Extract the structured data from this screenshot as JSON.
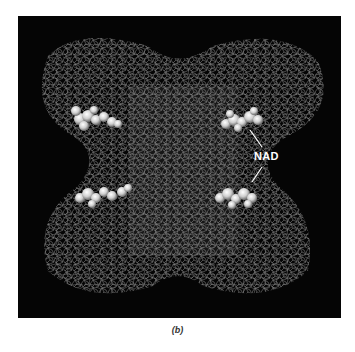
{
  "figure": {
    "panel_label": "(b)",
    "annotation": {
      "text": "NAD"
    },
    "colors": {
      "background": "#050505",
      "mesh": "#8a8a8a",
      "ligand": "#e8e8e8",
      "page": "#ffffff"
    }
  }
}
